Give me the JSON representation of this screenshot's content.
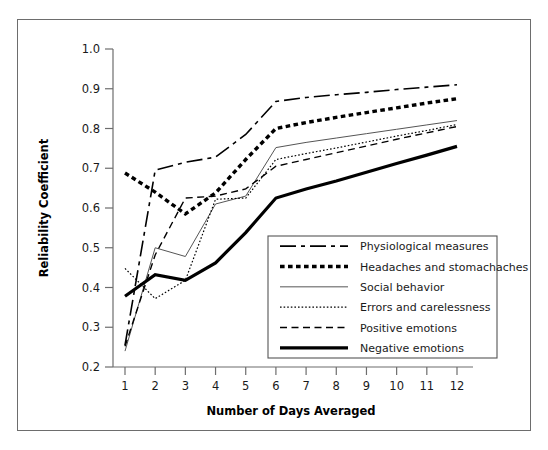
{
  "chart_data": {
    "type": "line",
    "title": "",
    "xlabel": "Number of Days Averaged",
    "ylabel": "Reliability Coefficient",
    "x": [
      1,
      2,
      3,
      4,
      5,
      6,
      7,
      8,
      9,
      10,
      11,
      12
    ],
    "xticklabels": [
      "1",
      "2",
      "3",
      "4",
      "5",
      "6",
      "7",
      "8",
      "9",
      "10",
      "11",
      "12"
    ],
    "yticklabels": [
      "0.2",
      "0.3",
      "0.4",
      "0.5",
      "0.6",
      "0.7",
      "0.8",
      "0.9",
      "1.0"
    ],
    "yticks": [
      0.2,
      0.3,
      0.4,
      0.5,
      0.6,
      0.7,
      0.8,
      0.9,
      1.0
    ],
    "xlim": [
      0.6,
      12.4
    ],
    "ylim": [
      0.2,
      1.0
    ],
    "grid": false,
    "legend_position": "lower right inside",
    "series": [
      {
        "name": "Physiological measures",
        "style": "dash-dot",
        "color": "#000000",
        "width": 1.6,
        "values": [
          0.255,
          0.695,
          0.715,
          0.728,
          0.785,
          0.868,
          0.878,
          0.885,
          0.891,
          0.898,
          0.904,
          0.91
        ]
      },
      {
        "name": "Headaches and stomachaches",
        "style": "thick-dotted",
        "color": "#000000",
        "width": 3.4,
        "values": [
          0.688,
          0.64,
          0.585,
          0.638,
          0.722,
          0.8,
          0.815,
          0.828,
          0.84,
          0.852,
          0.864,
          0.875
        ]
      },
      {
        "name": "Social behavior",
        "style": "thin-solid",
        "color": "#555555",
        "width": 1.0,
        "values": [
          0.24,
          0.5,
          0.478,
          0.61,
          0.63,
          0.752,
          0.765,
          0.776,
          0.787,
          0.798,
          0.809,
          0.82
        ]
      },
      {
        "name": "Errors and carelessness",
        "style": "fine-dotted",
        "color": "#000000",
        "width": 1.2,
        "values": [
          0.448,
          0.372,
          0.418,
          0.622,
          0.625,
          0.722,
          0.737,
          0.751,
          0.766,
          0.781,
          0.795,
          0.81
        ]
      },
      {
        "name": "Positive emotions",
        "style": "dashed",
        "color": "#000000",
        "width": 1.4,
        "values": [
          0.252,
          0.482,
          0.625,
          0.63,
          0.648,
          0.705,
          0.722,
          0.739,
          0.756,
          0.773,
          0.789,
          0.805
        ]
      },
      {
        "name": "Negative emotions",
        "style": "thick-solid",
        "color": "#000000",
        "width": 3.2,
        "values": [
          0.378,
          0.432,
          0.418,
          0.462,
          0.538,
          0.625,
          0.648,
          0.668,
          0.69,
          0.712,
          0.733,
          0.755
        ]
      }
    ]
  },
  "legend": {
    "items": [
      {
        "label": "Physiological measures"
      },
      {
        "label": "Headaches and stomachaches"
      },
      {
        "label": "Social behavior"
      },
      {
        "label": "Errors and carelessness"
      },
      {
        "label": "Positive emotions"
      },
      {
        "label": "Negative emotions"
      }
    ]
  }
}
